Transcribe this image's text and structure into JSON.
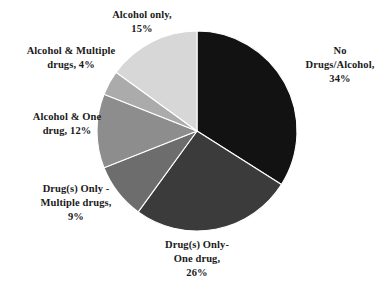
{
  "chart_data": {
    "type": "pie",
    "title": "",
    "subtitle": "",
    "xlabel": "",
    "ylabel": "",
    "legend_position": "none",
    "grid": false,
    "start_angle_deg": 0,
    "direction": "clockwise",
    "categories": [
      "No Drugs/Alcohol",
      "Drug(s) Only- One drug",
      "Drug(s) Only - Multiple drugs",
      "Alcohol & One drug",
      "Alcohol & Multiple drugs",
      "Alcohol only"
    ],
    "values": [
      34,
      26,
      9,
      12,
      4,
      15
    ],
    "value_unit": "%",
    "colors": [
      "#121212",
      "#3b3b3b",
      "#6d6d6d",
      "#8d8d8d",
      "#ababab",
      "#d7d7d7"
    ],
    "slices": [
      {
        "label": "No Drugs/Alcohol",
        "percent": 34,
        "color": "#121212",
        "label_text": "No\nDrugs/Alcohol,\n34%"
      },
      {
        "label": "Drug(s) Only- One drug",
        "percent": 26,
        "color": "#3b3b3b",
        "label_text": "Drug(s) Only-\nOne drug,\n26%"
      },
      {
        "label": "Drug(s) Only - Multiple drugs",
        "percent": 9,
        "color": "#6d6d6d",
        "label_text": "Drug(s) Only -\nMultiple drugs,\n9%"
      },
      {
        "label": "Alcohol & One drug",
        "percent": 12,
        "color": "#8d8d8d",
        "label_text": "Alcohol & One\ndrug, 12%"
      },
      {
        "label": "Alcohol & Multiple drugs",
        "percent": 4,
        "color": "#ababab",
        "label_text": "Alcohol & Multiple\ndrugs, 4%"
      },
      {
        "label": "Alcohol only",
        "percent": 15,
        "color": "#d7d7d7",
        "label_text": "Alcohol only,\n15%"
      }
    ]
  },
  "geometry": {
    "center_x": 197,
    "center_y": 131,
    "radius": 100,
    "separator_color": "#ffffff",
    "separator_width": 1.1
  }
}
